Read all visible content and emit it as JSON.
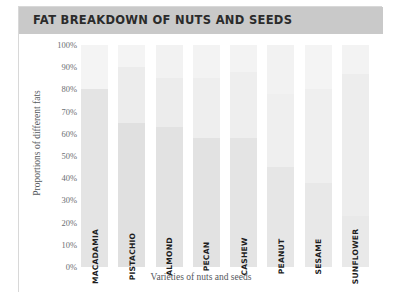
{
  "header": {
    "title": "FAT BREAKDOWN OF NUTS AND SEEDS",
    "band_color": "#c9c9c9"
  },
  "axes": {
    "y_title": "Proportions of different fats",
    "x_title": "Varieties of nuts and seeds",
    "y_ticks": [
      "100%",
      "90%",
      "80%",
      "70%",
      "60%",
      "50%",
      "40%",
      "30%",
      "20%",
      "10%",
      "0%"
    ]
  },
  "chart_data": {
    "type": "bar",
    "title": "FAT BREAKDOWN OF NUTS AND SEEDS",
    "subtype": "stacked-100-percent",
    "xlabel": "Varieties of nuts and seeds",
    "ylabel": "Proportions of different fats",
    "ylim": [
      0,
      100
    ],
    "ytick_labels": [
      "0%",
      "10%",
      "20%",
      "30%",
      "40%",
      "50%",
      "60%",
      "70%",
      "80%",
      "90%",
      "100%"
    ],
    "ytick_values": [
      0,
      10,
      20,
      30,
      40,
      50,
      60,
      70,
      80,
      90,
      100
    ],
    "grid": false,
    "legend": "none",
    "categories": [
      "MACADAMIA",
      "PISTACHIO",
      "ALMOND",
      "PECAN",
      "CASHEW",
      "PEANUT",
      "SESAME",
      "SUNFLOWER"
    ],
    "series": [
      {
        "name": "Polyunsaturated",
        "color": "#f2f2f2",
        "values": [
          20,
          10,
          15,
          15,
          12,
          22,
          20,
          13
        ]
      },
      {
        "name": "Monounsaturated",
        "color": "#e6e6e6",
        "values": [
          80,
          25,
          22,
          27,
          30,
          33,
          42,
          64
        ]
      },
      {
        "name": "Saturated",
        "color": "#dcdcdc",
        "values": [
          0,
          65,
          63,
          58,
          58,
          45,
          38,
          23
        ]
      }
    ],
    "stack_tops": {
      "MACADAMIA": [
        80,
        100
      ],
      "PISTACHIO": [
        65,
        90
      ],
      "ALMOND": [
        63,
        85
      ],
      "PECAN": [
        58,
        85
      ],
      "CASHEW": [
        58,
        88
      ],
      "PEANUT": [
        45,
        78
      ],
      "SESAME": [
        38,
        80
      ],
      "SUNFLOWER": [
        23,
        87
      ]
    }
  },
  "bars": [
    {
      "label": "MACADAMIA",
      "segments": [
        {
          "name": "top",
          "pct": 20,
          "color": "#f4f4f4"
        },
        {
          "name": "middle",
          "pct": 80,
          "color": "#e4e4e4"
        },
        {
          "name": "bottom",
          "pct": 0,
          "color": "#dadada"
        }
      ]
    },
    {
      "label": "PISTACHIO",
      "segments": [
        {
          "name": "top",
          "pct": 10,
          "color": "#f4f4f4"
        },
        {
          "name": "middle",
          "pct": 25,
          "color": "#ececec"
        },
        {
          "name": "bottom",
          "pct": 65,
          "color": "#e0e0e0"
        }
      ]
    },
    {
      "label": "ALMOND",
      "segments": [
        {
          "name": "top",
          "pct": 15,
          "color": "#f2f2f2"
        },
        {
          "name": "middle",
          "pct": 22,
          "color": "#ececec"
        },
        {
          "name": "bottom",
          "pct": 63,
          "color": "#e2e2e2"
        }
      ]
    },
    {
      "label": "PECAN",
      "segments": [
        {
          "name": "top",
          "pct": 15,
          "color": "#f3f3f3"
        },
        {
          "name": "middle",
          "pct": 27,
          "color": "#eeeeee"
        },
        {
          "name": "bottom",
          "pct": 58,
          "color": "#e2e2e2"
        }
      ]
    },
    {
      "label": "CASHEW",
      "segments": [
        {
          "name": "top",
          "pct": 12,
          "color": "#f3f3f3"
        },
        {
          "name": "middle",
          "pct": 30,
          "color": "#eeeeee"
        },
        {
          "name": "bottom",
          "pct": 58,
          "color": "#e4e4e4"
        }
      ]
    },
    {
      "label": "PEANUT",
      "segments": [
        {
          "name": "top",
          "pct": 22,
          "color": "#f2f2f2"
        },
        {
          "name": "middle",
          "pct": 33,
          "color": "#efefef"
        },
        {
          "name": "bottom",
          "pct": 45,
          "color": "#e6e6e6"
        }
      ]
    },
    {
      "label": "SESAME",
      "segments": [
        {
          "name": "top",
          "pct": 20,
          "color": "#f4f4f4"
        },
        {
          "name": "middle",
          "pct": 42,
          "color": "#efefef"
        },
        {
          "name": "bottom",
          "pct": 38,
          "color": "#e8e8e8"
        }
      ]
    },
    {
      "label": "SUNFLOWER",
      "segments": [
        {
          "name": "top",
          "pct": 13,
          "color": "#f3f3f3"
        },
        {
          "name": "middle",
          "pct": 64,
          "color": "#ededed"
        },
        {
          "name": "bottom",
          "pct": 23,
          "color": "#e9e9e9"
        }
      ]
    }
  ]
}
